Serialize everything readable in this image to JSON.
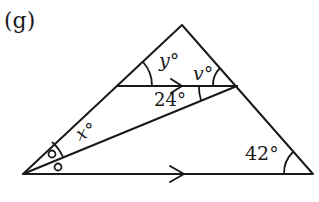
{
  "figure_label": "(g)",
  "angles": {
    "y": "y°",
    "v": "v°",
    "given_top": "24°",
    "x": "x°",
    "given_right": "42°"
  },
  "parallel_marker": "arrow",
  "equal_angle_marker": "circle",
  "colors": {
    "stroke": "#1a1a1a",
    "background": "#ffffff"
  }
}
